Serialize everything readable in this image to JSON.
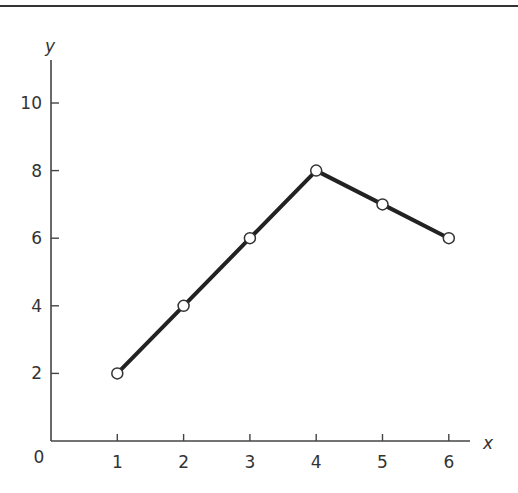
{
  "chart_data": {
    "type": "line",
    "title": "",
    "xlabel": "x",
    "ylabel": "y",
    "x": [
      1,
      2,
      3,
      4,
      5,
      6
    ],
    "values": [
      2,
      4,
      6,
      8,
      7,
      6
    ],
    "series": [
      {
        "name": "y",
        "x": [
          1,
          2,
          3,
          4,
          5,
          6
        ],
        "values": [
          2,
          4,
          6,
          8,
          7,
          6
        ]
      }
    ],
    "xticks": [
      1,
      2,
      3,
      4,
      5,
      6
    ],
    "yticks": [
      2,
      4,
      6,
      8,
      10
    ],
    "origin_label": "0",
    "xlim": [
      0,
      6.3
    ],
    "ylim": [
      0,
      11.2
    ],
    "grid": false,
    "legend": null,
    "markers": "open-circle",
    "line_color": "#222222",
    "marker_fill": "#ffffff"
  },
  "labels": {
    "x_axis": "x",
    "y_axis": "y",
    "origin": "0"
  }
}
